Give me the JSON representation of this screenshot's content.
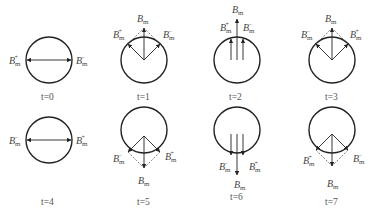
{
  "diagram": {
    "panels": [
      {
        "time_label": "t=0",
        "left_label": "B_m^+",
        "right_label": "B_m^-",
        "resultant": null
      },
      {
        "time_label": "t=1",
        "left_label": "B_m^+",
        "right_label": "B_m^-",
        "resultant": "B_m"
      },
      {
        "time_label": "t=2",
        "left_label": "B_m^+",
        "right_label": "B_m^-",
        "resultant": "B_m"
      },
      {
        "time_label": "t=3",
        "left_label": "B_m^-",
        "right_label": "B_m^+",
        "resultant": "B_m"
      },
      {
        "time_label": "t=4",
        "left_label": "B_m^-",
        "right_label": "B_m^+",
        "resultant": null
      },
      {
        "time_label": "t=5",
        "left_label": "B_m^-",
        "right_label": "B_m^+",
        "resultant": "B_m"
      },
      {
        "time_label": "t=6",
        "left_label": "B_m^-",
        "right_label": "B_m^+",
        "resultant": "B_m"
      },
      {
        "time_label": "t=7",
        "left_label": "B_m^+",
        "right_label": "B_m^-",
        "resultant": "B_m"
      }
    ],
    "symbols": {
      "base": "B",
      "sub": "m",
      "plus": "+",
      "minus": "−"
    }
  }
}
